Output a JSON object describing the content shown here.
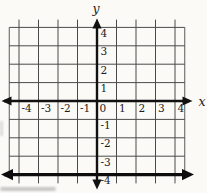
{
  "figure": {
    "origin_label": "0"
  },
  "chart_data": {
    "type": "line",
    "title": "",
    "xlabel": "x",
    "ylabel": "y",
    "xlim": [
      -4.5,
      4.5
    ],
    "ylim": [
      -4.5,
      4.5
    ],
    "grid": true,
    "x_ticks": [
      -4,
      -3,
      -2,
      -1,
      0,
      1,
      2,
      3,
      4
    ],
    "x_tick_labels": [
      "-4",
      "-3",
      "-2",
      "-1",
      "0",
      "1",
      "2",
      "3",
      "4"
    ],
    "y_ticks": [
      4,
      3,
      2,
      1,
      -1,
      -2,
      -3,
      -4
    ],
    "y_tick_labels": [
      "4",
      "3",
      "2",
      "1",
      "-1",
      "-2",
      "-3",
      "-4"
    ],
    "series": [
      {
        "name": "horizontal-line",
        "equation": "y = -4",
        "points": [
          [
            -4.5,
            -4
          ],
          [
            4.5,
            -4
          ]
        ]
      }
    ]
  },
  "colors": {
    "grid": "#4a4a4a",
    "grid_edge": "#5a5a5a",
    "axis": "#111111",
    "line": "#0d0d0d",
    "background": "#fbfaf7",
    "text": "#1c1c1c"
  }
}
